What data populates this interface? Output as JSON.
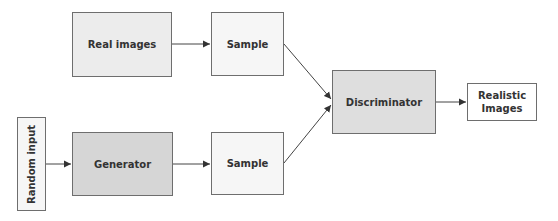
{
  "diagram": {
    "type": "flowchart",
    "nodes": [
      {
        "id": "real_images",
        "label": "Real images",
        "fill": "#ececec"
      },
      {
        "id": "sample_top",
        "label": "Sample",
        "fill": "#f6f6f6"
      },
      {
        "id": "random_input",
        "label": "Random input",
        "fill": "#f6f6f6"
      },
      {
        "id": "generator",
        "label": "Generator",
        "fill": "#d6d6d6"
      },
      {
        "id": "sample_bottom",
        "label": "Sample",
        "fill": "#f6f6f6"
      },
      {
        "id": "discriminator",
        "label": "Discriminator",
        "fill": "#dcdcdc"
      },
      {
        "id": "realistic_images",
        "label": "Realistic Images",
        "fill": "#ffffff"
      }
    ],
    "edges": [
      {
        "from": "real_images",
        "to": "sample_top"
      },
      {
        "from": "random_input",
        "to": "generator"
      },
      {
        "from": "generator",
        "to": "sample_bottom"
      },
      {
        "from": "sample_top",
        "to": "discriminator"
      },
      {
        "from": "sample_bottom",
        "to": "discriminator"
      },
      {
        "from": "discriminator",
        "to": "realistic_images"
      }
    ]
  },
  "labels": {
    "real_images": "Real images",
    "sample_top": "Sample",
    "random_input": "Random input",
    "generator": "Generator",
    "sample_bottom": "Sample",
    "discriminator": "Discriminator",
    "realistic_line1": "Realistic",
    "realistic_line2": "Images"
  }
}
